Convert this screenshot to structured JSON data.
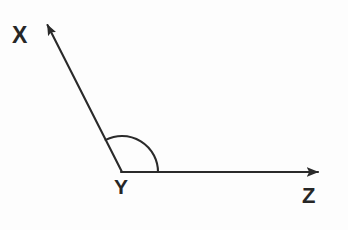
{
  "figure": {
    "type": "geometry-angle-diagram",
    "width": 348,
    "height": 230,
    "background_color": "#fdfdfd",
    "stroke_color": "#2a2a2a",
    "stroke_width": 2
  },
  "labels": {
    "ray_x_endpoint": "X",
    "vertex": "Y",
    "ray_z_endpoint": "Z"
  },
  "points": {
    "vertex": {
      "name": "Y",
      "x": 122,
      "y": 172
    },
    "ray_x_tip": {
      "name": "X",
      "x": 44,
      "y": 20
    },
    "ray_z_tip": {
      "name": "Z",
      "x": 328,
      "y": 172
    }
  },
  "rays": [
    {
      "name": "ray-YX",
      "from": "Y",
      "to": "X",
      "arrowhead": true,
      "angle_degrees": 117
    },
    {
      "name": "ray-YZ",
      "from": "Y",
      "to": "Z",
      "arrowhead": true,
      "angle_degrees": 0
    }
  ],
  "angle_arc": {
    "name": "angle-XYZ",
    "vertex": "Y",
    "radius": 36,
    "start_angle_degrees": 0,
    "end_angle_degrees": 117,
    "measure": "obtuse"
  }
}
